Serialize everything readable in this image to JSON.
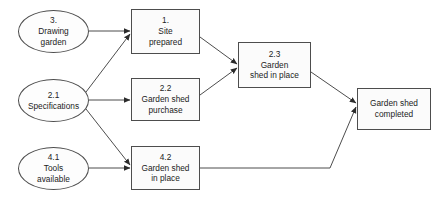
{
  "diagram": {
    "type": "flowchart",
    "background_color": "#ffffff",
    "node_border_color": "#4d4d4d",
    "node_fill_color": "#fbfbfb",
    "edge_color": "#4d4d4d",
    "text_color": "#1c1c1c",
    "nodes": [
      {
        "id": "drawing-garden",
        "shape": "ellipse",
        "number": "3.",
        "lines": [
          "3.",
          "Drawing",
          "garden"
        ],
        "x": 18,
        "y": 10,
        "w": 71,
        "h": 43
      },
      {
        "id": "specifications",
        "shape": "ellipse",
        "number": "2.1",
        "lines": [
          "2.1",
          "Specifications"
        ],
        "x": 18,
        "y": 79,
        "w": 71,
        "h": 43
      },
      {
        "id": "tools-available",
        "shape": "ellipse",
        "number": "4.1",
        "lines": [
          "4.1",
          "Tools",
          "available"
        ],
        "x": 18,
        "y": 147,
        "w": 71,
        "h": 43
      },
      {
        "id": "site-prepared",
        "shape": "box",
        "number": "1.",
        "lines": [
          "1.",
          "Site",
          "prepared"
        ],
        "x": 131,
        "y": 9,
        "w": 69,
        "h": 45
      },
      {
        "id": "garden-shed-purchase",
        "shape": "box",
        "number": "2.2",
        "lines": [
          "2.2",
          "Garden shed",
          "purchase"
        ],
        "x": 131,
        "y": 78,
        "w": 69,
        "h": 43
      },
      {
        "id": "garden-shed-in-place",
        "shape": "box",
        "number": "4.2",
        "lines": [
          "4.2",
          "Garden shed",
          "in place"
        ],
        "x": 131,
        "y": 146,
        "w": 69,
        "h": 44
      },
      {
        "id": "garden-shed-in-place-2-3",
        "shape": "box",
        "number": "2.3",
        "lines": [
          "2.3",
          "Garden",
          "shed in place"
        ],
        "x": 238,
        "y": 42,
        "w": 73,
        "h": 46
      },
      {
        "id": "garden-shed-completed",
        "shape": "box",
        "number": "",
        "lines": [
          "Garden shed",
          "completed"
        ],
        "x": 357,
        "y": 88,
        "w": 74,
        "h": 42
      }
    ],
    "edges": [
      {
        "id": "edge-drawing-to-site",
        "from": "drawing-garden",
        "to": "site-prepared",
        "style": "straight"
      },
      {
        "id": "edge-spec-to-site",
        "from": "specifications",
        "to": "site-prepared",
        "style": "straight"
      },
      {
        "id": "edge-spec-to-purchase",
        "from": "specifications",
        "to": "garden-shed-purchase",
        "style": "straight"
      },
      {
        "id": "edge-spec-to-shed-in-place",
        "from": "specifications",
        "to": "garden-shed-in-place",
        "style": "straight"
      },
      {
        "id": "edge-tools-to-shed-in-place",
        "from": "tools-available",
        "to": "garden-shed-in-place",
        "style": "straight"
      },
      {
        "id": "edge-site-to-2-3",
        "from": "site-prepared",
        "to": "garden-shed-in-place-2-3",
        "style": "straight"
      },
      {
        "id": "edge-purchase-to-2-3",
        "from": "garden-shed-purchase",
        "to": "garden-shed-in-place-2-3",
        "style": "straight"
      },
      {
        "id": "edge-2-3-to-completed",
        "from": "garden-shed-in-place-2-3",
        "to": "garden-shed-completed",
        "style": "straight"
      },
      {
        "id": "edge-4-2-to-completed",
        "from": "garden-shed-in-place",
        "to": "garden-shed-completed",
        "style": "elbow"
      }
    ]
  }
}
